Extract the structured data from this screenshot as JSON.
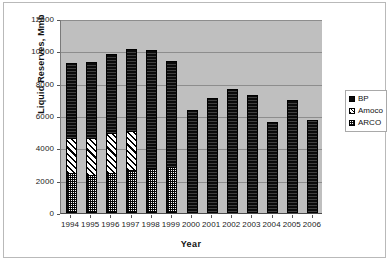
{
  "chart_data": {
    "type": "bar",
    "subtype": "stacked-column",
    "title": "",
    "xlabel": "Year",
    "ylabel": "Liquid Reserves, Mmb",
    "categories": [
      "1994",
      "1995",
      "1996",
      "1997",
      "1998",
      "1999",
      "2000",
      "2001",
      "2002",
      "2003",
      "2004",
      "2005",
      "2006"
    ],
    "ylim": [
      0,
      12000
    ],
    "ytick_labels": [
      "0",
      "2000",
      "4000",
      "6000",
      "8000",
      "10000",
      "12000"
    ],
    "ytick_values": [
      0,
      2000,
      4000,
      6000,
      8000,
      10000,
      12000
    ],
    "grid": true,
    "legend_position": "right",
    "plot_background": "#bfbfbf",
    "series": [
      {
        "name": "ARCO",
        "pattern": "dotted",
        "color": "#000000",
        "values": [
          2450,
          2350,
          2500,
          2650,
          2800,
          2850,
          0,
          0,
          0,
          0,
          0,
          0,
          0
        ]
      },
      {
        "name": "Amoco",
        "pattern": "diagonal-hatch",
        "color": "#000000",
        "values": [
          2200,
          2300,
          2450,
          2450,
          0,
          0,
          0,
          0,
          0,
          0,
          0,
          0,
          0
        ]
      },
      {
        "name": "BP",
        "pattern": "solid",
        "color": "#0a0a0a",
        "values": [
          4600,
          4700,
          4900,
          5050,
          7300,
          6550,
          6400,
          7100,
          7650,
          7300,
          5600,
          7000,
          5750
        ]
      }
    ],
    "totals": [
      9250,
      9350,
      9850,
      10150,
      10100,
      9400,
      6400,
      7100,
      7650,
      7300,
      5600,
      7000,
      5750
    ]
  },
  "legend": {
    "items": [
      {
        "label": "BP"
      },
      {
        "label": "Amoco"
      },
      {
        "label": "ARCO"
      }
    ]
  },
  "axes": {
    "y_title": "Liquid Reserves, Mmb",
    "x_title": "Year"
  }
}
